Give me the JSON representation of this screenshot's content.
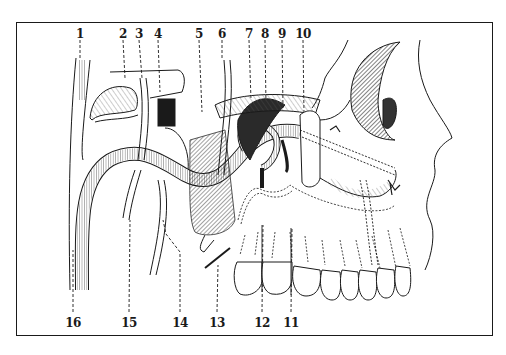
{
  "figure": {
    "type": "anatomical line drawing",
    "frame_color": "#1a1a1a",
    "ink_color": "#1a1a1a"
  },
  "labels_top": [
    {
      "id": "1",
      "text": "1",
      "x": 80
    },
    {
      "id": "2",
      "text": "2",
      "x": 123
    },
    {
      "id": "3",
      "text": "3",
      "x": 139
    },
    {
      "id": "4",
      "text": "4",
      "x": 158
    },
    {
      "id": "5",
      "text": "5",
      "x": 199
    },
    {
      "id": "6",
      "text": "6",
      "x": 222
    },
    {
      "id": "7",
      "text": "7",
      "x": 249
    },
    {
      "id": "8",
      "text": "8",
      "x": 265
    },
    {
      "id": "9",
      "text": "9",
      "x": 282
    },
    {
      "id": "10",
      "text": "10",
      "x": 303
    }
  ],
  "labels_bottom": [
    {
      "id": "16",
      "text": "16",
      "x": 73
    },
    {
      "id": "15",
      "text": "15",
      "x": 129
    },
    {
      "id": "14",
      "text": "14",
      "x": 180
    },
    {
      "id": "13",
      "text": "13",
      "x": 217
    },
    {
      "id": "12",
      "text": "12",
      "x": 262
    },
    {
      "id": "11",
      "text": "11",
      "x": 291
    }
  ]
}
